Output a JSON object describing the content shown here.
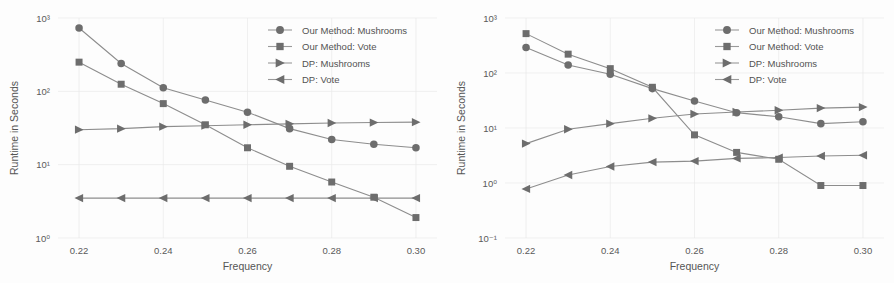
{
  "figure": {
    "background": "#fdfdfd",
    "marker_color": "#6d6d6d",
    "line_color": "#8d8d8d",
    "grid_color": "#e9e9e9",
    "text_color": "#525252"
  },
  "legend": {
    "position": "upper-right",
    "entries": [
      {
        "label": "Our Method: Mushrooms",
        "marker": "circle-icon"
      },
      {
        "label": "Our Method: Vote",
        "marker": "square-icon"
      },
      {
        "label": "DP: Mushrooms",
        "marker": "triangle-right-icon"
      },
      {
        "label": "DP: Vote",
        "marker": "triangle-left-icon"
      }
    ]
  },
  "chart_data": [
    {
      "id": "left-panel",
      "type": "line",
      "title": "",
      "xlabel": "Frequency",
      "ylabel": "Runtime in Seconds",
      "xscale": "linear",
      "yscale": "log",
      "xlim": [
        0.215,
        0.305
      ],
      "ylim": [
        1,
        1000
      ],
      "xticks": [
        0.22,
        0.24,
        0.26,
        0.28,
        0.3
      ],
      "xticklabels": [
        "0.22",
        "0.24",
        "0.26",
        "0.28",
        "0.30"
      ],
      "yticks": [
        1,
        10,
        100,
        1000
      ],
      "yticklabels": [
        "10⁰",
        "10¹",
        "10²",
        "10³"
      ],
      "grid": true,
      "legend": "upper right",
      "x": [
        0.22,
        0.23,
        0.24,
        0.25,
        0.26,
        0.27,
        0.28,
        0.29,
        0.3
      ],
      "series": [
        {
          "name": "Our Method: Mushrooms",
          "marker": "circle",
          "values": [
            730,
            240,
            112,
            76,
            52,
            31,
            22,
            19,
            17
          ]
        },
        {
          "name": "Our Method: Vote",
          "marker": "square",
          "values": [
            250,
            125,
            68,
            35,
            17,
            9.5,
            5.8,
            3.6,
            1.9
          ]
        },
        {
          "name": "DP: Mushrooms",
          "marker": "triangle-right",
          "values": [
            30,
            31,
            33,
            34,
            35,
            36,
            37,
            37.5,
            38
          ]
        },
        {
          "name": "DP: Vote",
          "marker": "triangle-left",
          "values": [
            3.5,
            3.5,
            3.5,
            3.5,
            3.5,
            3.5,
            3.5,
            3.5,
            3.5
          ]
        }
      ]
    },
    {
      "id": "right-panel",
      "type": "line",
      "title": "",
      "xlabel": "Frequency",
      "ylabel": "Runtime in Seconds",
      "xscale": "linear",
      "yscale": "log",
      "xlim": [
        0.215,
        0.305
      ],
      "ylim": [
        0.1,
        1000
      ],
      "xticks": [
        0.22,
        0.24,
        0.26,
        0.28,
        0.3
      ],
      "xticklabels": [
        "0.22",
        "0.24",
        "0.26",
        "0.28",
        "0.30"
      ],
      "yticks": [
        0.1,
        1,
        10,
        100,
        1000
      ],
      "yticklabels": [
        "10⁻¹",
        "10⁰",
        "10¹",
        "10²",
        "10³"
      ],
      "grid": true,
      "legend": "upper right",
      "x": [
        0.22,
        0.23,
        0.24,
        0.25,
        0.26,
        0.27,
        0.28,
        0.29,
        0.3
      ],
      "series": [
        {
          "name": "Our Method: Mushrooms",
          "marker": "circle",
          "values": [
            290,
            140,
            95,
            52,
            31,
            19,
            16,
            12,
            13
          ]
        },
        {
          "name": "Our Method: Vote",
          "marker": "square",
          "values": [
            520,
            220,
            120,
            55,
            7.5,
            3.6,
            2.7,
            0.9,
            0.9
          ]
        },
        {
          "name": "DP: Mushrooms",
          "marker": "triangle-right",
          "values": [
            5.2,
            9.5,
            12,
            15,
            18,
            19.5,
            21,
            23,
            24
          ]
        },
        {
          "name": "DP: Vote",
          "marker": "triangle-left",
          "values": [
            0.78,
            1.4,
            2.0,
            2.4,
            2.5,
            2.8,
            2.9,
            3.1,
            3.2
          ]
        }
      ]
    }
  ]
}
